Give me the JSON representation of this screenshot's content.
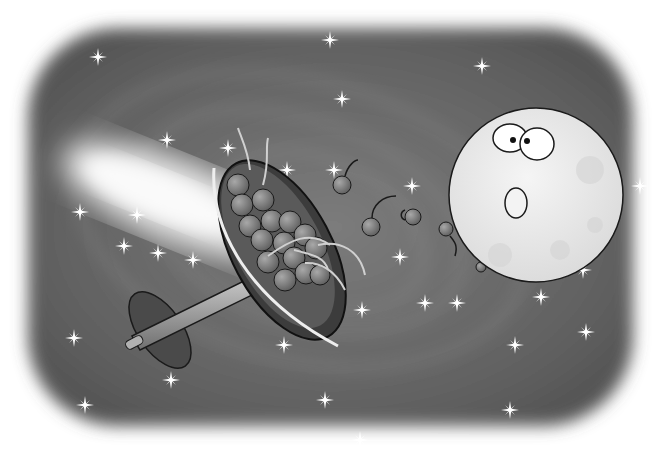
{
  "image": {
    "description": "Grayscale cartoon illustration: a moon with a surprised face blowing cherries out of a tilted bowl/dish on a stand, floating in a starry spiral galaxy background with soft rounded vignette edges.",
    "colors": {
      "background": "#ffffff",
      "space_dark": "#5a5a5a",
      "space_mid": "#7a7a7a",
      "glow": "#f2f2f2",
      "moon": "#ececec",
      "cherry": "#8a8a8a",
      "bowl": "#4a4a4a",
      "outline": "#1a1a1a"
    },
    "elements": [
      "galaxy-background",
      "glow-streak",
      "stars",
      "bowl-on-stand",
      "cherries",
      "moon-face"
    ]
  }
}
